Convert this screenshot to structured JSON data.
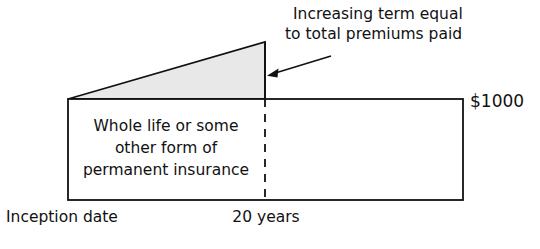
{
  "diagram": {
    "type": "insurance-coverage-schematic",
    "callout": {
      "lines": [
        "Increasing term equal",
        "to total premiums paid"
      ],
      "anchor_label": "arrow-to-increasing-term"
    },
    "permanent_block": {
      "lines": [
        "Whole life or some",
        "other form of",
        "permanent insurance"
      ]
    },
    "axis_labels": {
      "left": "Inception date",
      "mid": "20 years"
    },
    "value_label": "$1000",
    "colors": {
      "stroke": "#111111",
      "shaded_fill": "#e8e8e8",
      "background": "#ffffff"
    },
    "geometry": {
      "box": {
        "x": 68,
        "y": 99,
        "width": 395,
        "height": 101
      },
      "triangle": {
        "left_x": 68,
        "base_y": 99,
        "apex_x": 265,
        "apex_y": 42
      },
      "divider_x": 265,
      "arrow": {
        "x1": 331,
        "y1": 56,
        "x2": 269,
        "y2": 75
      }
    }
  }
}
